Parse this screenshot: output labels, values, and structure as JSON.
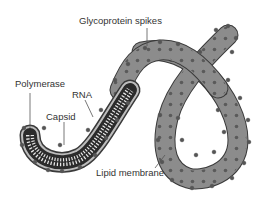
{
  "diagram": {
    "labels": {
      "glycoprotein_spikes": "Glycoprotein spikes",
      "polymerase": "Polymerase",
      "rna": "RNA",
      "capsid": "Capsid",
      "lipid_membrane": "Lipid membrane"
    },
    "colors": {
      "background": "#ffffff",
      "membrane_fill": "#8a8a8a",
      "membrane_outline": "#3a3a3a",
      "spike": "#555555",
      "capsid_dark": "#2b2b2b",
      "rna_light": "#e8e8e8",
      "text": "#333333",
      "leader_line": "#555555"
    }
  }
}
